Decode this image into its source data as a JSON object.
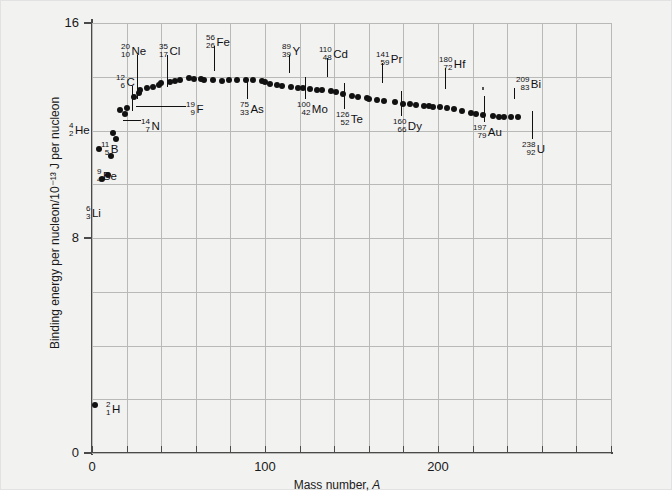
{
  "figure": {
    "background": "#f2f2f1",
    "point_color": "#111111",
    "grid_color": "#b9b9b7",
    "axis_color": "#4a4a4a"
  },
  "chart_data": {
    "type": "scatter",
    "title": "",
    "xlabel": "Mass number, A",
    "ylabel": "Binding energy per nucleon/10⁻¹³ J per nucleon",
    "xlim": [
      0,
      300
    ],
    "ylim": [
      0,
      16
    ],
    "xticks": [
      0,
      100,
      200
    ],
    "xtick_labels": [
      "0",
      "100",
      "200"
    ],
    "yticks": [
      0,
      8,
      16
    ],
    "ytick_labels": [
      "0",
      "8",
      "16"
    ],
    "grid": true,
    "grid_x_step": 20,
    "grid_y_step": 2,
    "legend": "none",
    "x": [
      2,
      4,
      6,
      9,
      11,
      12,
      14,
      16,
      19,
      20,
      24,
      27,
      28,
      32,
      35,
      39,
      40,
      45,
      48,
      51,
      56,
      59,
      63,
      65,
      70,
      75,
      79,
      84,
      89,
      93,
      98,
      100,
      103,
      107,
      110,
      115,
      119,
      122,
      126,
      130,
      133,
      138,
      141,
      145,
      150,
      154,
      159,
      160,
      165,
      169,
      175,
      180,
      184,
      187,
      192,
      195,
      197,
      201,
      205,
      209,
      214,
      219,
      222,
      226,
      232,
      235,
      238,
      242,
      246
    ],
    "y": [
      1.79,
      11.33,
      10.2,
      10.35,
      11.06,
      11.89,
      11.7,
      12.76,
      12.6,
      12.85,
      13.25,
      13.4,
      13.5,
      13.6,
      13.62,
      13.7,
      13.75,
      13.8,
      13.85,
      13.88,
      13.97,
      13.93,
      13.9,
      13.89,
      13.88,
      13.85,
      13.87,
      13.88,
      13.89,
      13.88,
      13.85,
      13.8,
      13.72,
      13.68,
      13.66,
      13.62,
      13.6,
      13.58,
      13.55,
      13.52,
      13.5,
      13.47,
      13.42,
      13.36,
      13.3,
      13.24,
      13.2,
      13.18,
      13.14,
      13.1,
      13.05,
      13.0,
      12.97,
      12.94,
      12.92,
      12.9,
      12.88,
      12.86,
      12.84,
      12.8,
      12.72,
      12.66,
      12.62,
      12.58,
      12.54,
      12.52,
      12.5,
      12.5,
      12.5
    ],
    "labels": [
      {
        "mass": "2",
        "z": "1",
        "symbol": "H"
      },
      {
        "mass": "4",
        "z": "2",
        "symbol": "He"
      },
      {
        "mass": "6",
        "z": "3",
        "symbol": "Li"
      },
      {
        "mass": "9",
        "z": "4",
        "symbol": "Be"
      },
      {
        "mass": "11",
        "z": "5",
        "symbol": "B"
      },
      {
        "mass": "12",
        "z": "6",
        "symbol": "C"
      },
      {
        "mass": "14",
        "z": "7",
        "symbol": "N"
      },
      {
        "mass": "19",
        "z": "9",
        "symbol": "F"
      },
      {
        "mass": "20",
        "z": "10",
        "symbol": "Ne"
      },
      {
        "mass": "35",
        "z": "17",
        "symbol": "Cl"
      },
      {
        "mass": "56",
        "z": "26",
        "symbol": "Fe"
      },
      {
        "mass": "75",
        "z": "33",
        "symbol": "As"
      },
      {
        "mass": "89",
        "z": "39",
        "symbol": "Y"
      },
      {
        "mass": "100",
        "z": "42",
        "symbol": "Mo"
      },
      {
        "mass": "110",
        "z": "48",
        "symbol": "Cd"
      },
      {
        "mass": "126",
        "z": "52",
        "symbol": "Te"
      },
      {
        "mass": "141",
        "z": "59",
        "symbol": "Pr"
      },
      {
        "mass": "160",
        "z": "66",
        "symbol": "Dy"
      },
      {
        "mass": "180",
        "z": "72",
        "symbol": "Hf"
      },
      {
        "mass": "197",
        "z": "79",
        "symbol": "Au"
      },
      {
        "mass": "209",
        "z": "83",
        "symbol": "Bi"
      },
      {
        "mass": "238",
        "z": "92",
        "symbol": "U"
      }
    ]
  }
}
